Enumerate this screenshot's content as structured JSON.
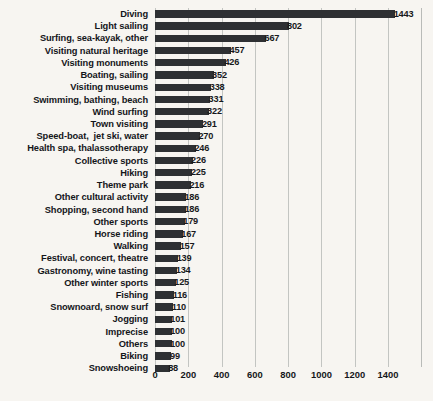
{
  "chart_data": {
    "type": "bar",
    "orientation": "horizontal",
    "title": "",
    "xlabel": "",
    "ylabel": "",
    "xlim": [
      0,
      1604
    ],
    "grid": true,
    "legend": false,
    "xticks": [
      "0",
      "200",
      "400",
      "600",
      "800",
      "1000",
      "1200",
      "1400"
    ],
    "xtick_values": [
      0,
      200,
      400,
      600,
      800,
      1000,
      1200,
      1400
    ],
    "bar_color": "#2e3033",
    "background_color": "#f7f5f1",
    "gridline_color": "#c3c5c2",
    "categories": [
      "Diving",
      "Light sailing",
      "Surfing, sea-kayak, other",
      "Visiting natural heritage",
      "Visiting monuments",
      "Boating, sailing",
      "Visiting museums",
      "Swimming, bathing, beach",
      "Wind surfing",
      "Town visiting",
      "Speed-boat,  jet ski, water",
      "Health spa, thalassotherapy",
      "Collective sports",
      "Hiking",
      "Theme park",
      "Other cultural activity",
      "Shopping, second hand",
      "Other sports",
      "Horse riding",
      "Walking",
      "Festival, concert, theatre",
      "Gastronomy, wine tasting",
      "Other winter sports",
      "Fishing",
      "Snownoard, snow surf",
      "Jogging",
      "Imprecise",
      "Others",
      "Biking",
      "Snowshoeing"
    ],
    "values": [
      1443,
      802,
      667,
      457,
      426,
      352,
      338,
      331,
      322,
      291,
      270,
      246,
      226,
      225,
      216,
      186,
      186,
      179,
      167,
      157,
      139,
      134,
      125,
      116,
      110,
      101,
      100,
      100,
      99,
      88
    ]
  }
}
